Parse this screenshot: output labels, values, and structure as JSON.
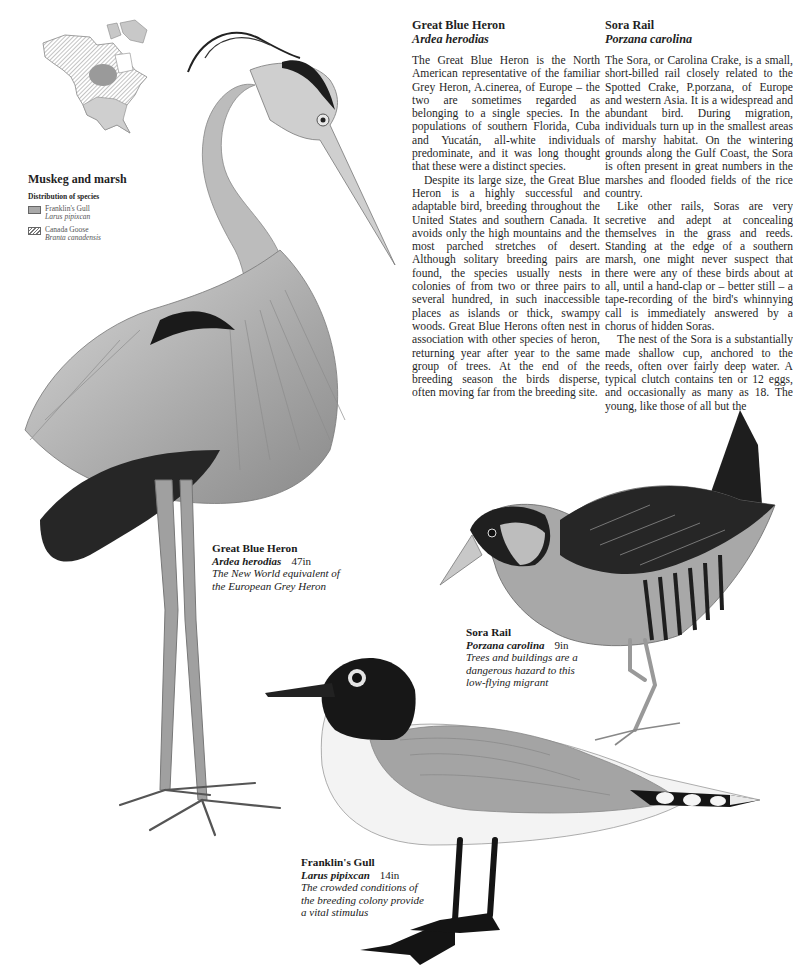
{
  "map": {
    "title": "Muskeg and marsh",
    "subtitle": "Distribution of species",
    "legend": [
      {
        "swatch": "solid-grey",
        "common": "Franklin's Gull",
        "latin": "Larus pipixcan"
      },
      {
        "swatch": "hatched",
        "common": "Canada Goose",
        "latin": "Branta canadensis"
      }
    ]
  },
  "articles": [
    {
      "title": "Great Blue Heron",
      "latin": "Ardea herodias",
      "paragraphs": [
        "The Great Blue Heron is the North American representative of the familiar Grey Heron, A.cinerea, of Europe – the two are sometimes regarded as belonging to a single species. In the populations of south­ern Florida, Cuba and Yucatán, all-white individuals predominate, and it was long thought that these were a distinct species.",
        "Despite its large size, the Great Blue Heron is a highly successful and adaptable bird, breeding throughout the United States and southern Canada. It avoids only the high mountains and the most parched stretches of desert. Although solitary breeding pairs are found, the species usually nests in colonies of from two or three pairs to several hundred, in such inaccessible places as islands or thick, swampy woods. Great Blue Herons often nest in association with other species of heron, returning year after year to the same group of trees. At the end of the breeding season the birds disperse, often moving far from the breeding site."
      ]
    },
    {
      "title": "Sora Rail",
      "latin": "Porzana carolina",
      "paragraphs": [
        "The Sora, or Carolina Crake, is a small, short-billed rail closely related to the Spotted Crake, P.porzana, of Europe and western Asia. It is a widespread and abundant bird. During migration, individuals turn up in the smallest areas of marshy habitat. On the wintering grounds along the Gulf Coast, the Sora is often present in great numbers in the marshes and flooded fields of the rice country.",
        "Like other rails, Soras are very secretive and adept at concealing themselves in the grass and reeds. Standing at the edge of a southern marsh, one might never suspect that there were any of these birds about at all, until a hand-clap or – better still – a tape-recording of the bird's whinnying call is immediately an­swered by a chorus of hidden Soras.",
        "The nest of the Sora is a substan­tially made shallow cup, anchored to the reeds, often over fairly deep water. A typical clutch contains ten or 12 eggs, and occasionally as many as 18. The young, like those of all but the"
      ]
    }
  ],
  "captions": [
    {
      "name": "Great Blue Heron",
      "latin": "Ardea herodias",
      "size": "47in",
      "desc": "The New World equivalent of the European Grey Heron"
    },
    {
      "name": "Sora Rail",
      "latin": "Porzana carolina",
      "size": "9in",
      "desc": "Trees and buildings are a dangerous hazard to this low-flying migrant"
    },
    {
      "name": "Franklin's Gull",
      "latin": "Larus pipixcan",
      "size": "14in",
      "desc": "The crowded conditions of the breeding colony provide a vital stimulus"
    }
  ],
  "colors": {
    "text": "#1f1f1f",
    "gull_range": "#a9a9a9",
    "hatch": "#777777"
  }
}
